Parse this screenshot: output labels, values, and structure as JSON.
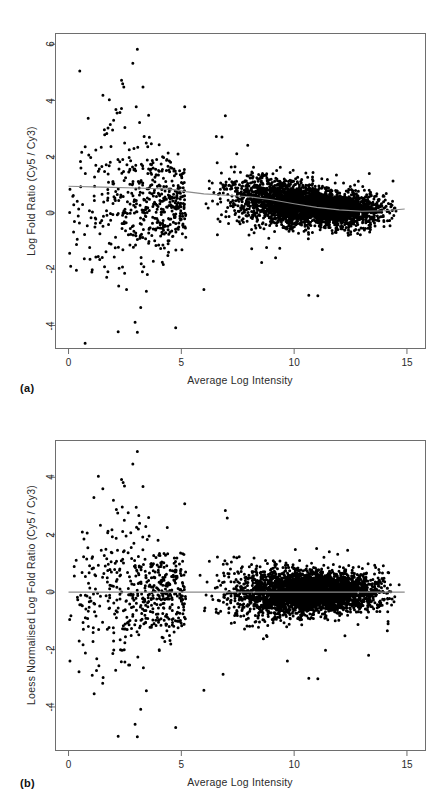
{
  "figure": {
    "background": "#ffffff",
    "point_color": "#000000",
    "axis_color": "#6e6e6e",
    "curve_color": "#8a8a8a"
  },
  "panels": [
    {
      "id": "a",
      "caption": "(a)",
      "plot_box": {
        "left": 55,
        "top": 33,
        "width": 370,
        "height": 315
      },
      "chart_data": {
        "type": "scatter",
        "title": "",
        "xlabel": "Average Log Intensity",
        "ylabel": "Log Fold Ratio (Cy5 / Cy3)",
        "xlim": [
          -0.6,
          15.8
        ],
        "ylim": [
          -4.8,
          6.4
        ],
        "xticks": [
          0,
          5,
          10,
          15
        ],
        "xtick_labels": [
          "0",
          "5",
          "10",
          "15"
        ],
        "yticks": [
          -4,
          -2,
          0,
          2,
          4,
          6
        ],
        "ytick_labels": [
          "-4",
          "-2",
          "0",
          "2",
          "4",
          "6"
        ],
        "grid": false,
        "legend": "none",
        "n_points": 4200,
        "point_size_px": 3.0,
        "series": [
          {
            "name": "Spots (unnormalised M vs A)",
            "description": "Microarray log-ratio cloud, right-skewed dense core centred above zero with a long sparse low-intensity tail",
            "cloud": {
              "core_x_range": [
                5.0,
                14.9
              ],
              "core_density_peak_x": 11.0,
              "core_center_offset": 0.38,
              "core_spread_at_x5": 0.62,
              "core_spread_at_x11": 0.3,
              "core_spread_at_x15": 0.34,
              "tail_x_range": [
                0.0,
                5.2
              ],
              "tail_spread": 1.55,
              "tail_n": 520
            },
            "notable_outliers": [
              {
                "x": 3.05,
                "y": 5.82
              },
              {
                "x": 2.85,
                "y": 5.32
              },
              {
                "x": 2.35,
                "y": 4.72
              },
              {
                "x": 2.4,
                "y": 4.6
              },
              {
                "x": 2.45,
                "y": 4.48
              },
              {
                "x": 3.3,
                "y": 4.48
              },
              {
                "x": 3.0,
                "y": 3.78
              },
              {
                "x": 5.15,
                "y": 3.78
              },
              {
                "x": 2.1,
                "y": 3.68
              },
              {
                "x": 2.15,
                "y": 3.56
              },
              {
                "x": 3.55,
                "y": 3.48
              },
              {
                "x": 6.95,
                "y": 3.46
              },
              {
                "x": 3.15,
                "y": 3.22
              },
              {
                "x": 1.75,
                "y": 3.02
              },
              {
                "x": 3.35,
                "y": 2.72
              },
              {
                "x": 6.55,
                "y": 2.72
              },
              {
                "x": 6.8,
                "y": 2.7
              },
              {
                "x": 1.45,
                "y": 2.34
              },
              {
                "x": 0.55,
                "y": 1.6
              },
              {
                "x": 0.05,
                "y": 0.02
              },
              {
                "x": 1.05,
                "y": -2.02
              },
              {
                "x": 3.45,
                "y": -2.78
              },
              {
                "x": 6.0,
                "y": -2.72
              },
              {
                "x": 10.65,
                "y": -2.92
              },
              {
                "x": 11.05,
                "y": -2.94
              },
              {
                "x": 3.2,
                "y": -3.36
              },
              {
                "x": 2.95,
                "y": -3.88
              },
              {
                "x": 2.2,
                "y": -4.22
              },
              {
                "x": 3.05,
                "y": -4.24
              },
              {
                "x": 4.75,
                "y": -4.08
              }
            ]
          }
        ],
        "fit_curve": {
          "name": "Loess fit",
          "color": "#8a8a8a",
          "points": [
            {
              "x": 0.0,
              "y": 0.95
            },
            {
              "x": 1.5,
              "y": 0.92
            },
            {
              "x": 3.0,
              "y": 0.89
            },
            {
              "x": 4.5,
              "y": 0.85
            },
            {
              "x": 5.2,
              "y": 0.76
            },
            {
              "x": 6.0,
              "y": 0.68
            },
            {
              "x": 7.0,
              "y": 0.63
            },
            {
              "x": 8.0,
              "y": 0.58
            },
            {
              "x": 9.0,
              "y": 0.47
            },
            {
              "x": 10.0,
              "y": 0.33
            },
            {
              "x": 11.0,
              "y": 0.2
            },
            {
              "x": 12.0,
              "y": 0.11
            },
            {
              "x": 13.0,
              "y": 0.06
            },
            {
              "x": 14.0,
              "y": 0.08
            },
            {
              "x": 14.9,
              "y": 0.14
            }
          ]
        }
      }
    },
    {
      "id": "b",
      "caption": "(b)",
      "plot_box": {
        "left": 55,
        "top": 440,
        "width": 370,
        "height": 310
      },
      "chart_data": {
        "type": "scatter",
        "title": "",
        "xlabel": "Average Log Intensity",
        "ylabel": "Loess Normalised Log Fold Ratio (Cy5 / Cy3)",
        "xlim": [
          -0.6,
          15.8
        ],
        "ylim": [
          -5.5,
          5.3
        ],
        "xticks": [
          0,
          5,
          10,
          15
        ],
        "xtick_labels": [
          "0",
          "5",
          "10",
          "15"
        ],
        "yticks": [
          -4,
          -2,
          0,
          2,
          4
        ],
        "ytick_labels": [
          "-4",
          "-2",
          "0",
          "2",
          "4"
        ],
        "grid": false,
        "legend": "none",
        "n_points": 4200,
        "point_size_px": 3.0,
        "series": [
          {
            "name": "Spots (loess normalised M vs A)",
            "description": "Same cloud after loess normalisation; dense core now centred on zero across the whole intensity range",
            "cloud": {
              "core_x_range": [
                5.0,
                14.9
              ],
              "core_density_peak_x": 11.0,
              "core_center_offset": 0.0,
              "core_spread_at_x5": 0.6,
              "core_spread_at_x11": 0.32,
              "core_spread_at_x15": 0.34,
              "tail_x_range": [
                0.0,
                5.2
              ],
              "tail_spread": 1.55,
              "tail_n": 520
            },
            "notable_outliers": [
              {
                "x": 3.05,
                "y": 4.9
              },
              {
                "x": 2.85,
                "y": 4.46
              },
              {
                "x": 2.35,
                "y": 3.92
              },
              {
                "x": 2.42,
                "y": 3.82
              },
              {
                "x": 2.48,
                "y": 3.7
              },
              {
                "x": 3.3,
                "y": 3.68
              },
              {
                "x": 5.15,
                "y": 3.08
              },
              {
                "x": 3.0,
                "y": 2.96
              },
              {
                "x": 2.12,
                "y": 2.88
              },
              {
                "x": 2.18,
                "y": 2.76
              },
              {
                "x": 6.95,
                "y": 2.84
              },
              {
                "x": 3.55,
                "y": 2.6
              },
              {
                "x": 3.15,
                "y": 2.4
              },
              {
                "x": 1.75,
                "y": 2.12
              },
              {
                "x": 1.45,
                "y": 1.46
              },
              {
                "x": 0.6,
                "y": 0.68
              },
              {
                "x": 0.05,
                "y": -0.95
              },
              {
                "x": 1.05,
                "y": -2.9
              },
              {
                "x": 3.45,
                "y": -3.44
              },
              {
                "x": 6.0,
                "y": -3.42
              },
              {
                "x": 6.85,
                "y": -2.86
              },
              {
                "x": 10.65,
                "y": -3.0
              },
              {
                "x": 11.05,
                "y": -3.02
              },
              {
                "x": 3.2,
                "y": -4.08
              },
              {
                "x": 2.95,
                "y": -4.6
              },
              {
                "x": 2.2,
                "y": -5.02
              },
              {
                "x": 3.05,
                "y": -5.04
              },
              {
                "x": 4.75,
                "y": -4.72
              },
              {
                "x": 13.3,
                "y": -2.2
              },
              {
                "x": 9.7,
                "y": -2.4
              }
            ]
          }
        ],
        "fit_curve": {
          "name": "Zero reference line",
          "color": "#8a8a8a",
          "points": [
            {
              "x": 0.0,
              "y": 0.0
            },
            {
              "x": 14.9,
              "y": 0.0
            }
          ]
        }
      }
    }
  ]
}
